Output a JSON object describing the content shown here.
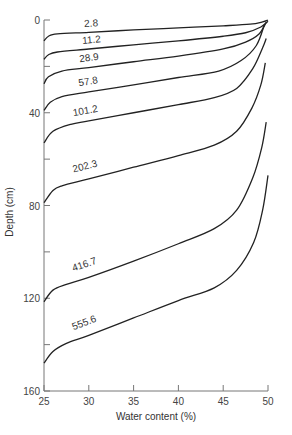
{
  "chart_data": {
    "type": "line",
    "title": "",
    "xlabel": "Water content (%)",
    "ylabel": "Depth (cm)",
    "xlim": [
      25,
      50
    ],
    "ylim": [
      0,
      160
    ],
    "y_inverted": true,
    "grid": false,
    "x_ticks": [
      25,
      30,
      35,
      40,
      45,
      50
    ],
    "x_tick_labels": [
      "25",
      "30",
      "35",
      "40",
      "45",
      "50"
    ],
    "y_ticks": [
      0,
      20,
      40,
      60,
      80,
      100,
      120,
      140,
      160
    ],
    "y_tick_labels": [
      "0",
      "",
      "40",
      "",
      "80",
      "",
      "120",
      "",
      "160"
    ],
    "series": [
      {
        "name": "2.8",
        "label": "2.8",
        "points": [
          [
            25,
            9
          ],
          [
            25.5,
            7
          ],
          [
            26.5,
            6
          ],
          [
            30,
            5.3
          ],
          [
            35,
            4.3
          ],
          [
            40,
            3.4
          ],
          [
            45,
            2.5
          ],
          [
            48,
            1.8
          ],
          [
            49.4,
            0.8
          ],
          [
            50,
            0
          ]
        ]
      },
      {
        "name": "11.2",
        "label": "11.2",
        "points": [
          [
            25,
            17
          ],
          [
            25.5,
            15
          ],
          [
            26.5,
            13.8
          ],
          [
            30,
            12.5
          ],
          [
            35,
            10.7
          ],
          [
            40,
            9
          ],
          [
            45,
            7
          ],
          [
            47.5,
            5.5
          ],
          [
            49.2,
            3
          ],
          [
            50,
            0.5
          ]
        ]
      },
      {
        "name": "28.9",
        "label": "28.9",
        "points": [
          [
            25,
            27.5
          ],
          [
            25.5,
            24.5
          ],
          [
            27,
            22
          ],
          [
            30,
            20.5
          ],
          [
            35,
            18
          ],
          [
            40,
            15.6
          ],
          [
            45,
            12.5
          ],
          [
            47.5,
            9.5
          ],
          [
            49,
            6
          ],
          [
            49.8,
            1
          ]
        ]
      },
      {
        "name": "57.8",
        "label": "57.8",
        "points": [
          [
            25,
            39
          ],
          [
            25.7,
            35.5
          ],
          [
            27,
            33
          ],
          [
            30,
            31
          ],
          [
            35,
            28
          ],
          [
            40,
            24.8
          ],
          [
            44.5,
            22
          ],
          [
            47,
            17.5
          ],
          [
            48.7,
            11
          ],
          [
            49.6,
            2
          ]
        ]
      },
      {
        "name": "101.2",
        "label": "101.2",
        "points": [
          [
            25,
            53
          ],
          [
            26,
            48
          ],
          [
            28,
            45
          ],
          [
            30,
            43.5
          ],
          [
            35,
            40
          ],
          [
            40,
            36.5
          ],
          [
            44,
            33.5
          ],
          [
            46.5,
            29.5
          ],
          [
            48.3,
            21
          ],
          [
            49.4,
            12
          ],
          [
            49.8,
            8
          ]
        ]
      },
      {
        "name": "202.3",
        "label": "202.3",
        "points": [
          [
            25,
            78.8
          ],
          [
            26,
            73.5
          ],
          [
            27,
            71.5
          ],
          [
            30,
            68.5
          ],
          [
            35,
            63.5
          ],
          [
            40,
            58.5
          ],
          [
            44,
            54
          ],
          [
            46.5,
            48
          ],
          [
            48.2,
            38
          ],
          [
            49.2,
            28
          ],
          [
            49.7,
            18.5
          ]
        ]
      },
      {
        "name": "416.7",
        "label": "416.7",
        "points": [
          [
            25,
            121.5
          ],
          [
            26,
            116.5
          ],
          [
            27.5,
            114
          ],
          [
            30,
            111
          ],
          [
            35,
            104
          ],
          [
            40,
            96.5
          ],
          [
            44,
            90
          ],
          [
            46.5,
            82
          ],
          [
            48.3,
            68
          ],
          [
            49.3,
            55
          ],
          [
            49.8,
            44
          ]
        ]
      },
      {
        "name": "555.6",
        "label": "555.6",
        "points": [
          [
            25,
            148
          ],
          [
            26,
            143
          ],
          [
            27.5,
            139.5
          ],
          [
            30,
            136
          ],
          [
            35,
            128.5
          ],
          [
            40,
            121
          ],
          [
            44,
            115.5
          ],
          [
            46.5,
            108
          ],
          [
            48.4,
            96
          ],
          [
            49.4,
            82
          ],
          [
            50,
            67
          ]
        ]
      }
    ],
    "label_positions": [
      {
        "series": "2.8",
        "x": 29.5,
        "depth": 3
      },
      {
        "series": "11.2",
        "x": 29.3,
        "depth": 10.3
      },
      {
        "series": "28.9",
        "x": 29.0,
        "depth": 18.2
      },
      {
        "series": "57.8",
        "x": 28.9,
        "depth": 28.6
      },
      {
        "series": "101.2",
        "x": 28.3,
        "depth": 41.5
      },
      {
        "series": "202.3",
        "x": 28.3,
        "depth": 65.8
      },
      {
        "series": "416.7",
        "x": 28.3,
        "depth": 108.5
      },
      {
        "series": "555.6",
        "x": 28.3,
        "depth": 133.8
      }
    ]
  }
}
